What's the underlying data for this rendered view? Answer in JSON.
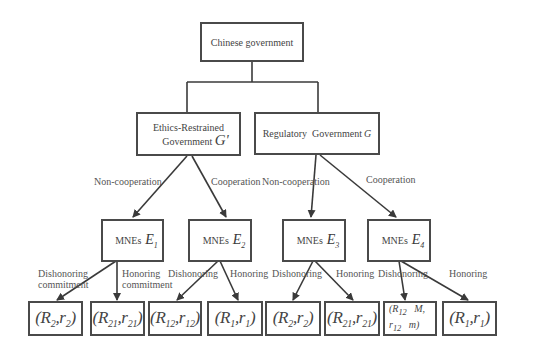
{
  "root": {
    "label": "Chinese government"
  },
  "level2": [
    {
      "label_line1": "Ethics-Restrained",
      "label_line2": "Government",
      "symbol": "G'"
    },
    {
      "label": "Regulatory  Government",
      "symbol": "G"
    }
  ],
  "edges_level2": [
    {
      "label": "Non-cooperation"
    },
    {
      "label": "Cooperation"
    },
    {
      "label": "Non-cooperation"
    },
    {
      "label": "Cooperation"
    }
  ],
  "level3": [
    {
      "label": "MNEs",
      "symbol": "E",
      "sub": "1"
    },
    {
      "label": "MNEs",
      "symbol": "E",
      "sub": "2"
    },
    {
      "label": "MNEs",
      "symbol": "E",
      "sub": "3"
    },
    {
      "label": "MNEs",
      "symbol": "E",
      "sub": "4"
    }
  ],
  "edges_level3": [
    {
      "line1": "Dishonoring",
      "line2": "commitment"
    },
    {
      "line1": "Honoring",
      "line2": "commitment"
    },
    {
      "line1": "Dishonoring"
    },
    {
      "line1": "Honoring"
    },
    {
      "line1": "Dishonoring"
    },
    {
      "line1": "Honoring"
    },
    {
      "line1": "Dishonoring"
    },
    {
      "line1": "Honoring"
    }
  ],
  "leaves": [
    {
      "R": "R",
      "Rsub": "2",
      "r": "r",
      "rsub": "2"
    },
    {
      "R": "R",
      "Rsub": "21",
      "r": "r",
      "rsub": "21"
    },
    {
      "R": "R",
      "Rsub": "12",
      "r": "r",
      "rsub": "12"
    },
    {
      "R": "R",
      "Rsub": "1",
      "r": "r",
      "rsub": "1"
    },
    {
      "R": "R",
      "Rsub": "2",
      "r": "r",
      "rsub": "2"
    },
    {
      "R": "R",
      "Rsub": "21",
      "r": "r",
      "rsub": "21"
    },
    {
      "line1_R": "(R",
      "line1_Rsub": "12",
      "line1_M": "M,",
      "line2_r": "r",
      "line2_rsub": "12",
      "line2_m": "m)"
    },
    {
      "R": "R",
      "Rsub": "1",
      "r": "r",
      "rsub": "1"
    }
  ],
  "punct": {
    "open": "(",
    "comma": ",",
    "close": ")"
  }
}
